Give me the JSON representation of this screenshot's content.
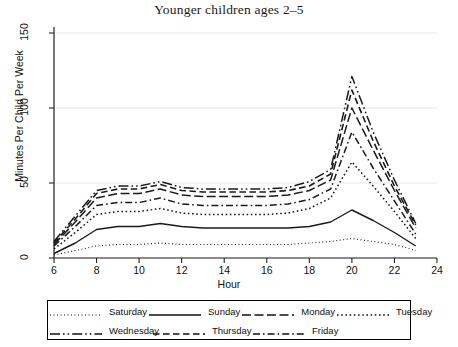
{
  "chart_data": {
    "type": "line",
    "title": "Younger children ages 2–5",
    "xlabel": "Hour",
    "ylabel": "Minutes Per Child Per Week",
    "xlim": [
      6,
      24
    ],
    "ylim": [
      0,
      150
    ],
    "xticks": [
      6,
      8,
      10,
      12,
      14,
      16,
      18,
      20,
      22,
      24
    ],
    "yticks": [
      0,
      50,
      100,
      150
    ],
    "grid": "horizontal-faint",
    "legend_position": "below-axes",
    "x": [
      6,
      7,
      8,
      9,
      10,
      11,
      12,
      13,
      14,
      15,
      16,
      17,
      18,
      19,
      20,
      21,
      22,
      23
    ],
    "series": [
      {
        "name": "Saturday",
        "dash": "1,2.5",
        "width": 1.1,
        "values": [
          2,
          5,
          8,
          9,
          9,
          10,
          9,
          9,
          9,
          9,
          9,
          9,
          10,
          11,
          13,
          11,
          9,
          5
        ]
      },
      {
        "name": "Sunday",
        "dash": "none",
        "width": 1.4,
        "values": [
          3,
          10,
          19,
          21,
          21,
          23,
          21,
          20,
          20,
          20,
          20,
          20,
          21,
          24,
          32,
          25,
          17,
          8
        ]
      },
      {
        "name": "Monday",
        "dash": "9,3.5",
        "width": 1.5,
        "values": [
          9,
          24,
          40,
          43,
          43,
          46,
          42,
          41,
          41,
          41,
          41,
          42,
          45,
          52,
          100,
          72,
          45,
          20
        ]
      },
      {
        "name": "Tuesday",
        "dash": "1.6,2.6",
        "width": 1.5,
        "values": [
          6,
          17,
          29,
          31,
          31,
          33,
          30,
          29,
          29,
          29,
          29,
          30,
          33,
          40,
          64,
          48,
          31,
          13
        ]
      },
      {
        "name": "Wednesday",
        "dash": "10,3,1.6,3,1.6,3",
        "width": 1.5,
        "values": [
          11,
          28,
          45,
          48,
          48,
          51,
          47,
          46,
          46,
          46,
          46,
          47,
          51,
          59,
          121,
          84,
          52,
          23
        ]
      },
      {
        "name": "Thursday",
        "dash": "6.5,3.5",
        "width": 1.6,
        "values": [
          10,
          26,
          43,
          46,
          46,
          49,
          45,
          44,
          44,
          44,
          44,
          45,
          48,
          56,
          112,
          78,
          48,
          22
        ]
      },
      {
        "name": "Friday",
        "dash": "7,3,1.6,3",
        "width": 1.5,
        "values": [
          8,
          21,
          35,
          37,
          37,
          40,
          36,
          35,
          35,
          35,
          35,
          36,
          39,
          46,
          84,
          60,
          38,
          16
        ]
      }
    ]
  },
  "legend": {
    "row1": [
      "Saturday",
      "Sunday",
      "Monday",
      "Tuesday"
    ],
    "row2": [
      "Wednesday",
      "Thursday",
      "Friday"
    ]
  }
}
